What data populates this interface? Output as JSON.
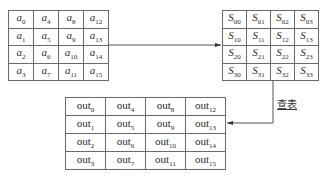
{
  "diagram": {
    "input_matrix": {
      "symbol": "a",
      "rows": [
        [
          "0",
          "4",
          "8",
          "12"
        ],
        [
          "1",
          "5",
          "9",
          "13"
        ],
        [
          "2",
          "6",
          "10",
          "14"
        ],
        [
          "3",
          "7",
          "11",
          "15"
        ]
      ]
    },
    "sbox_matrix": {
      "symbol": "S",
      "rows": [
        [
          "00",
          "01",
          "02",
          "03"
        ],
        [
          "10",
          "11",
          "12",
          "13"
        ],
        [
          "20",
          "21",
          "22",
          "23"
        ],
        [
          "30",
          "31",
          "32",
          "33"
        ]
      ]
    },
    "output_matrix": {
      "symbol": "out",
      "rows": [
        [
          "0",
          "4",
          "8",
          "12"
        ],
        [
          "1",
          "5",
          "9",
          "13"
        ],
        [
          "2",
          "6",
          "10",
          "14"
        ],
        [
          "3",
          "7",
          "11",
          "15"
        ]
      ]
    },
    "lookup_label": "查表",
    "colors": {
      "line": "#555555",
      "border": "#6a6a6a",
      "text": "#2a2a2a"
    }
  }
}
